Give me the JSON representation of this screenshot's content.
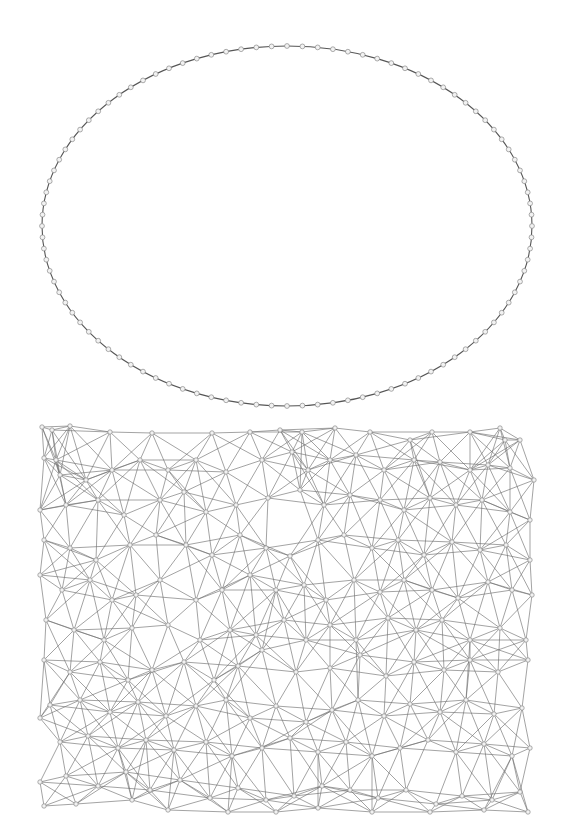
{
  "figure": {
    "background": "#ffffff",
    "edge_color": "#6e6e6e",
    "node_fill": "#f2f2f2",
    "node_stroke": "#8a8a8a",
    "panels": [
      {
        "id": "ring-graph",
        "layout": "circular",
        "node_count": 100,
        "center": [
          287,
          226
        ],
        "radius": [
          245,
          180
        ],
        "node_radius": 2.4
      },
      {
        "id": "mesh-graph",
        "layout": "force-directed",
        "node_radius": 2.2,
        "connect_distance": 62,
        "nodes": [
          [
            42,
            427
          ],
          [
            52,
            430
          ],
          [
            70,
            426
          ],
          [
            44,
            458
          ],
          [
            56,
            460
          ],
          [
            110,
            432
          ],
          [
            152,
            433
          ],
          [
            212,
            433
          ],
          [
            250,
            432
          ],
          [
            280,
            430
          ],
          [
            302,
            432
          ],
          [
            335,
            428
          ],
          [
            370,
            432
          ],
          [
            410,
            440
          ],
          [
            432,
            432
          ],
          [
            470,
            432
          ],
          [
            500,
            428
          ],
          [
            505,
            440
          ],
          [
            520,
            440
          ],
          [
            488,
            465
          ],
          [
            60,
            475
          ],
          [
            86,
            480
          ],
          [
            112,
            470
          ],
          [
            140,
            460
          ],
          [
            168,
            470
          ],
          [
            196,
            460
          ],
          [
            226,
            472
          ],
          [
            262,
            460
          ],
          [
            292,
            452
          ],
          [
            308,
            470
          ],
          [
            330,
            460
          ],
          [
            356,
            455
          ],
          [
            384,
            470
          ],
          [
            414,
            460
          ],
          [
            440,
            462
          ],
          [
            470,
            470
          ],
          [
            510,
            468
          ],
          [
            534,
            480
          ],
          [
            40,
            510
          ],
          [
            66,
            505
          ],
          [
            98,
            500
          ],
          [
            124,
            515
          ],
          [
            160,
            500
          ],
          [
            184,
            492
          ],
          [
            206,
            512
          ],
          [
            236,
            505
          ],
          [
            268,
            498
          ],
          [
            300,
            490
          ],
          [
            324,
            505
          ],
          [
            350,
            495
          ],
          [
            380,
            500
          ],
          [
            404,
            510
          ],
          [
            430,
            498
          ],
          [
            456,
            505
          ],
          [
            482,
            500
          ],
          [
            510,
            512
          ],
          [
            530,
            520
          ],
          [
            44,
            540
          ],
          [
            70,
            548
          ],
          [
            96,
            560
          ],
          [
            130,
            545
          ],
          [
            156,
            535
          ],
          [
            186,
            545
          ],
          [
            212,
            555
          ],
          [
            240,
            535
          ],
          [
            266,
            548
          ],
          [
            290,
            556
          ],
          [
            318,
            540
          ],
          [
            344,
            535
          ],
          [
            372,
            548
          ],
          [
            398,
            540
          ],
          [
            424,
            555
          ],
          [
            452,
            542
          ],
          [
            480,
            550
          ],
          [
            506,
            545
          ],
          [
            530,
            560
          ],
          [
            40,
            575
          ],
          [
            62,
            590
          ],
          [
            90,
            580
          ],
          [
            112,
            600
          ],
          [
            136,
            595
          ],
          [
            160,
            580
          ],
          [
            196,
            600
          ],
          [
            222,
            590
          ],
          [
            250,
            575
          ],
          [
            276,
            590
          ],
          [
            304,
            585
          ],
          [
            326,
            600
          ],
          [
            354,
            580
          ],
          [
            380,
            592
          ],
          [
            404,
            580
          ],
          [
            432,
            590
          ],
          [
            458,
            598
          ],
          [
            488,
            582
          ],
          [
            512,
            590
          ],
          [
            532,
            595
          ],
          [
            46,
            620
          ],
          [
            74,
            630
          ],
          [
            104,
            640
          ],
          [
            132,
            628
          ],
          [
            168,
            625
          ],
          [
            200,
            640
          ],
          [
            230,
            630
          ],
          [
            256,
            635
          ],
          [
            284,
            620
          ],
          [
            306,
            640
          ],
          [
            330,
            625
          ],
          [
            356,
            640
          ],
          [
            388,
            618
          ],
          [
            416,
            630
          ],
          [
            442,
            620
          ],
          [
            470,
            640
          ],
          [
            500,
            628
          ],
          [
            526,
            640
          ],
          [
            44,
            660
          ],
          [
            70,
            672
          ],
          [
            100,
            662
          ],
          [
            128,
            680
          ],
          [
            152,
            670
          ],
          [
            184,
            662
          ],
          [
            214,
            680
          ],
          [
            238,
            666
          ],
          [
            262,
            650
          ],
          [
            296,
            672
          ],
          [
            330,
            668
          ],
          [
            360,
            655
          ],
          [
            386,
            676
          ],
          [
            414,
            662
          ],
          [
            444,
            670
          ],
          [
            470,
            660
          ],
          [
            498,
            672
          ],
          [
            528,
            660
          ],
          [
            50,
            705
          ],
          [
            80,
            700
          ],
          [
            110,
            712
          ],
          [
            138,
            702
          ],
          [
            166,
            716
          ],
          [
            196,
            706
          ],
          [
            226,
            700
          ],
          [
            250,
            718
          ],
          [
            276,
            706
          ],
          [
            306,
            722
          ],
          [
            332,
            710
          ],
          [
            358,
            700
          ],
          [
            384,
            716
          ],
          [
            410,
            704
          ],
          [
            440,
            712
          ],
          [
            466,
            700
          ],
          [
            494,
            714
          ],
          [
            522,
            708
          ],
          [
            40,
            718
          ],
          [
            60,
            742
          ],
          [
            88,
            736
          ],
          [
            118,
            748
          ],
          [
            146,
            740
          ],
          [
            174,
            750
          ],
          [
            206,
            742
          ],
          [
            232,
            756
          ],
          [
            262,
            748
          ],
          [
            290,
            738
          ],
          [
            318,
            752
          ],
          [
            346,
            742
          ],
          [
            372,
            756
          ],
          [
            400,
            748
          ],
          [
            428,
            740
          ],
          [
            456,
            752
          ],
          [
            484,
            744
          ],
          [
            512,
            756
          ],
          [
            530,
            748
          ],
          [
            40,
            782
          ],
          [
            66,
            776
          ],
          [
            98,
            786
          ],
          [
            126,
            772
          ],
          [
            150,
            790
          ],
          [
            180,
            780
          ],
          [
            210,
            798
          ],
          [
            238,
            788
          ],
          [
            266,
            800
          ],
          [
            294,
            796
          ],
          [
            322,
            786
          ],
          [
            350,
            790
          ],
          [
            378,
            798
          ],
          [
            406,
            790
          ],
          [
            436,
            804
          ],
          [
            462,
            796
          ],
          [
            492,
            800
          ],
          [
            520,
            792
          ],
          [
            44,
            806
          ],
          [
            76,
            804
          ],
          [
            132,
            800
          ],
          [
            168,
            810
          ],
          [
            228,
            812
          ],
          [
            276,
            812
          ],
          [
            318,
            808
          ],
          [
            372,
            812
          ],
          [
            430,
            812
          ],
          [
            484,
            810
          ],
          [
            528,
            812
          ]
        ]
      }
    ]
  }
}
